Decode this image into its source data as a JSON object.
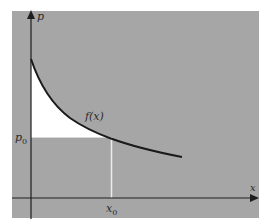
{
  "figure": {
    "type": "economics-diagram",
    "colors": {
      "panel_background": "#a6a6a6",
      "highlight_region": "#ffffff",
      "axis": "#1e1e1e",
      "curve": "#1a1a1a",
      "guide_line": "#ececec",
      "page_background": "#ffffff"
    }
  },
  "axes": {
    "y_label": "p",
    "x_label": "x"
  },
  "curve": {
    "label": "f(x)"
  },
  "markers": {
    "price_level_label": "p",
    "price_level_subscript": "0",
    "quantity_label": "x",
    "quantity_subscript": "0"
  },
  "regions": {
    "highlighted": "area between curve and p0 line, left of x0 (white)",
    "below_p0": "rectangle under p0 from axis to x0 (gray)"
  }
}
